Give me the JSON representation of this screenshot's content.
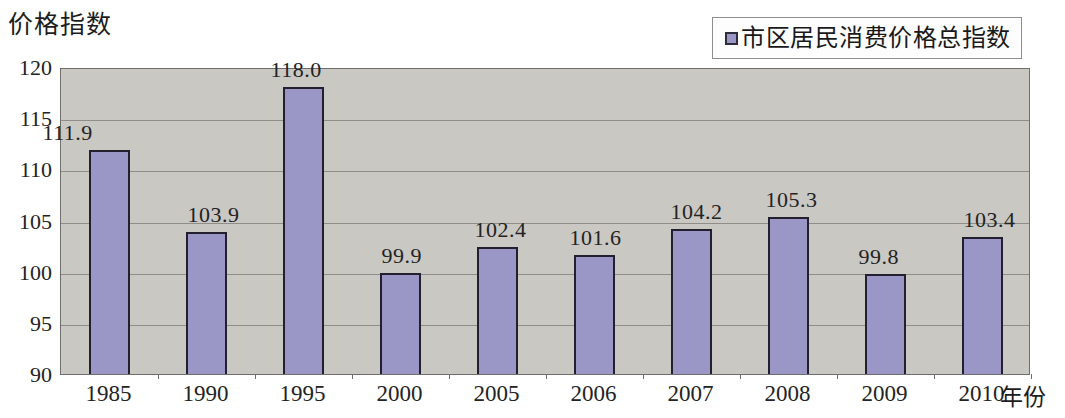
{
  "chart_data": {
    "type": "bar",
    "title": "",
    "ylabel": "价格指数",
    "xlabel": "年份",
    "categories": [
      "1985",
      "1990",
      "1995",
      "2000",
      "2005",
      "2006",
      "2007",
      "2008",
      "2009",
      "2010"
    ],
    "values": [
      111.9,
      103.9,
      118.0,
      99.9,
      102.4,
      101.6,
      104.2,
      105.3,
      99.8,
      103.4
    ],
    "value_labels": [
      "111.9",
      "103.9",
      "118.0",
      "99.9",
      "102.4",
      "101.6",
      "104.2",
      "105.3",
      "99.8",
      "103.4"
    ],
    "series": [
      {
        "name": "市区居民消费价格总指数",
        "values": [
          111.9,
          103.9,
          118.0,
          99.9,
          102.4,
          101.6,
          104.2,
          105.3,
          99.8,
          103.4
        ],
        "color": "#9a96c6"
      }
    ],
    "ylim": [
      90,
      120
    ],
    "y_ticks": [
      "120",
      "115",
      "110",
      "105",
      "100",
      "95",
      "90"
    ],
    "y_tick_values": [
      120,
      115,
      110,
      105,
      100,
      95,
      90
    ],
    "grid": true,
    "grid_axis": "y",
    "legend_position": "top-right",
    "plot_background": "#c9c8c3",
    "bar_border_color": "#231f2e"
  },
  "legend": {
    "entries": [
      {
        "label": "市区居民消费价格总指数",
        "color": "#9a96c6"
      }
    ]
  },
  "axes": {
    "y_title": "价格指数",
    "x_title": "年份"
  }
}
